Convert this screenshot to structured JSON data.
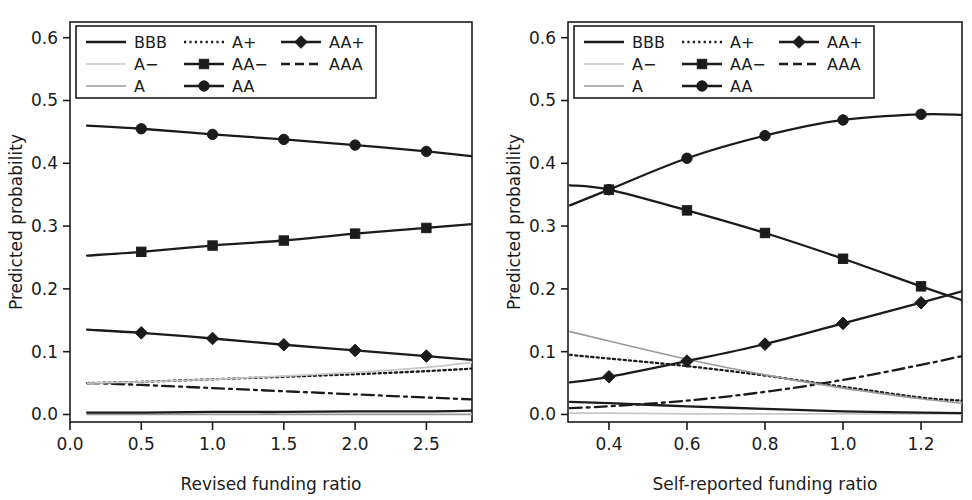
{
  "figure": {
    "y_axis_label": "Predicted probability",
    "y_ticks": [
      "0.0",
      "0.1",
      "0.2",
      "0.3",
      "0.4",
      "0.5",
      "0.6"
    ],
    "legend": {
      "entries": [
        {
          "label": "BBB",
          "style": "solid",
          "color": "#1b1b1b",
          "marker": "none",
          "row": 0,
          "col": 0
        },
        {
          "label": "A+",
          "style": "dotted",
          "color": "#1b1b1b",
          "marker": "none",
          "row": 0,
          "col": 1
        },
        {
          "label": "AA+",
          "style": "solid",
          "color": "#1b1b1b",
          "marker": "diamond",
          "row": 0,
          "col": 2
        },
        {
          "label": "A−",
          "style": "solid",
          "color": "#c8c8c8",
          "marker": "none",
          "row": 1,
          "col": 0
        },
        {
          "label": "AA−",
          "style": "solid",
          "color": "#1b1b1b",
          "marker": "square",
          "row": 1,
          "col": 1
        },
        {
          "label": "AAA",
          "style": "dashed",
          "color": "#1b1b1b",
          "marker": "none",
          "row": 1,
          "col": 2
        },
        {
          "label": "A",
          "style": "solid",
          "color": "#9a9a9a",
          "marker": "none",
          "row": 2,
          "col": 0
        },
        {
          "label": "AA",
          "style": "solid",
          "color": "#1b1b1b",
          "marker": "circle",
          "row": 2,
          "col": 1
        }
      ]
    }
  },
  "chart_data": [
    {
      "id": "left",
      "type": "line",
      "title": "",
      "xlabel": "Revised funding ratio",
      "ylabel": "Predicted probability",
      "xlim": [
        0.0,
        2.82
      ],
      "ylim": [
        -0.012,
        0.625
      ],
      "xticks": [
        0.0,
        0.5,
        1.0,
        1.5,
        2.0,
        2.5
      ],
      "xtick_labels": [
        "0.0",
        "0.5",
        "1.0",
        "1.5",
        "2.0",
        "2.5"
      ],
      "yticks": [
        0.0,
        0.1,
        0.2,
        0.3,
        0.4,
        0.5,
        0.6
      ],
      "ytick_labels": [
        "0.0",
        "0.1",
        "0.2",
        "0.3",
        "0.4",
        "0.5",
        "0.6"
      ],
      "grid": false,
      "legend_position": "top-left",
      "x_line": [
        0.12,
        0.5,
        1.0,
        1.5,
        2.0,
        2.5,
        2.82
      ],
      "marker_x": [
        0.5,
        1.0,
        1.5,
        2.0,
        2.5
      ],
      "series": [
        {
          "name": "AA",
          "style": "solid",
          "color": "#1b1b1b",
          "marker": "circle",
          "values": [
            0.46,
            0.455,
            0.446,
            0.438,
            0.429,
            0.419,
            0.411
          ],
          "marker_values": [
            0.455,
            0.446,
            0.438,
            0.429,
            0.419
          ]
        },
        {
          "name": "AA−",
          "style": "solid",
          "color": "#1b1b1b",
          "marker": "square",
          "values": [
            0.253,
            0.259,
            0.269,
            0.277,
            0.288,
            0.297,
            0.303
          ],
          "marker_values": [
            0.259,
            0.269,
            0.277,
            0.288,
            0.297
          ]
        },
        {
          "name": "AA+",
          "style": "solid",
          "color": "#1b1b1b",
          "marker": "diamond",
          "values": [
            0.135,
            0.13,
            0.121,
            0.111,
            0.102,
            0.093,
            0.087
          ],
          "marker_values": [
            0.13,
            0.121,
            0.111,
            0.102,
            0.093
          ]
        },
        {
          "name": "A−",
          "style": "solid",
          "color": "#c8c8c8",
          "marker": "none",
          "values": [
            0.05,
            0.052,
            0.056,
            0.061,
            0.067,
            0.075,
            0.083
          ],
          "marker_values": []
        },
        {
          "name": "A+",
          "style": "dotted",
          "color": "#1b1b1b",
          "marker": "none",
          "values": [
            0.05,
            0.052,
            0.056,
            0.06,
            0.064,
            0.069,
            0.073
          ],
          "marker_values": []
        },
        {
          "name": "AAA",
          "style": "dashdot",
          "color": "#1b1b1b",
          "marker": "none",
          "values": [
            0.05,
            0.047,
            0.042,
            0.037,
            0.032,
            0.027,
            0.024
          ],
          "marker_values": []
        },
        {
          "name": "BBB",
          "style": "solid",
          "color": "#1b1b1b",
          "marker": "none",
          "values": [
            0.003,
            0.003,
            0.004,
            0.004,
            0.005,
            0.005,
            0.006
          ],
          "marker_values": []
        },
        {
          "name": "A",
          "style": "solid",
          "color": "#9a9a9a",
          "marker": "none",
          "values": [
            0.0,
            0.0,
            0.0,
            0.0,
            0.0,
            0.0,
            0.0
          ],
          "marker_values": []
        }
      ]
    },
    {
      "id": "right",
      "type": "line",
      "title": "",
      "xlabel": "Self-reported funding ratio",
      "ylabel": "Predicted probability",
      "xlim": [
        0.295,
        1.305
      ],
      "ylim": [
        -0.012,
        0.625
      ],
      "xticks": [
        0.4,
        0.6,
        0.8,
        1.0,
        1.2
      ],
      "xtick_labels": [
        "0.4",
        "0.6",
        "0.8",
        "1.0",
        "1.2"
      ],
      "yticks": [
        0.0,
        0.1,
        0.2,
        0.3,
        0.4,
        0.5,
        0.6
      ],
      "ytick_labels": [
        "0.0",
        "0.1",
        "0.2",
        "0.3",
        "0.4",
        "0.5",
        "0.6"
      ],
      "grid": false,
      "legend_position": "top-left",
      "x_line": [
        0.3,
        0.4,
        0.6,
        0.8,
        1.0,
        1.2,
        1.305
      ],
      "marker_x": [
        0.4,
        0.6,
        0.8,
        1.0,
        1.2
      ],
      "series": [
        {
          "name": "AA",
          "style": "solid",
          "color": "#1b1b1b",
          "marker": "circle",
          "values": [
            0.333,
            0.358,
            0.408,
            0.444,
            0.469,
            0.478,
            0.477
          ],
          "marker_values": [
            0.358,
            0.408,
            0.444,
            0.469,
            0.478
          ]
        },
        {
          "name": "AA−",
          "style": "solid",
          "color": "#1b1b1b",
          "marker": "square",
          "values": [
            0.365,
            0.358,
            0.325,
            0.289,
            0.248,
            0.204,
            0.182
          ],
          "marker_values": [
            0.358,
            0.325,
            0.289,
            0.248,
            0.204
          ]
        },
        {
          "name": "AA+",
          "style": "solid",
          "color": "#1b1b1b",
          "marker": "diamond",
          "values": [
            0.051,
            0.06,
            0.085,
            0.112,
            0.145,
            0.178,
            0.196
          ],
          "marker_values": [
            0.06,
            0.085,
            0.112,
            0.145,
            0.178
          ]
        },
        {
          "name": "A−",
          "style": "solid",
          "color": "#9a9a9a",
          "marker": "none",
          "values": [
            0.132,
            0.117,
            0.088,
            0.063,
            0.042,
            0.025,
            0.018
          ],
          "marker_values": []
        },
        {
          "name": "A+",
          "style": "dotted",
          "color": "#1b1b1b",
          "marker": "none",
          "values": [
            0.095,
            0.089,
            0.077,
            0.062,
            0.044,
            0.027,
            0.022
          ],
          "marker_values": []
        },
        {
          "name": "AAA",
          "style": "dashdot",
          "color": "#1b1b1b",
          "marker": "none",
          "values": [
            0.01,
            0.013,
            0.022,
            0.036,
            0.055,
            0.079,
            0.093
          ],
          "marker_values": []
        },
        {
          "name": "BBB",
          "style": "solid",
          "color": "#1b1b1b",
          "marker": "none",
          "values": [
            0.02,
            0.018,
            0.013,
            0.009,
            0.005,
            0.003,
            0.002
          ],
          "marker_values": []
        },
        {
          "name": "A",
          "style": "solid",
          "color": "#c8c8c8",
          "marker": "none",
          "values": [
            0.002,
            0.002,
            0.001,
            0.001,
            0.001,
            0.001,
            0.001
          ],
          "marker_values": []
        }
      ]
    }
  ]
}
